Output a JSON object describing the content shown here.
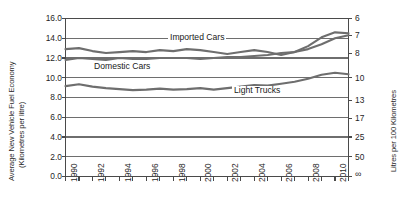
{
  "chart_data": {
    "type": "line",
    "title": "",
    "xlabel": "",
    "ylabel": "Average New Vehicle Fuel Economy (Kilometres per litre)",
    "ylabel_right": "Litres per 100 Kilometres",
    "xlim": [
      1990,
      2011
    ],
    "ylim": [
      0.0,
      16.0
    ],
    "grid": true,
    "legend_position": "inline-labels",
    "y_ticks": [
      "16.0",
      "14.0",
      "12.0",
      "10.0",
      "8.0",
      "6.0",
      "4.0",
      "2.0",
      "0.0"
    ],
    "y_tick_values": [
      16.0,
      14.0,
      12.0,
      10.0,
      8.0,
      6.0,
      4.0,
      2.0,
      0.0
    ],
    "y_ticks_right": [
      "6",
      "7",
      "8",
      "10",
      "13",
      "17",
      "25",
      "50",
      "∞"
    ],
    "y_tick_right_values": [
      16.67,
      14.29,
      12.5,
      10.0,
      7.69,
      5.88,
      4.0,
      2.0,
      0.0
    ],
    "x_ticks_labeled": [
      "1990",
      "1992",
      "1994",
      "1996",
      "1998",
      "2000",
      "2002",
      "2004",
      "2006",
      "2008",
      "2010"
    ],
    "x_tick_values_all": [
      1990,
      1991,
      1992,
      1993,
      1994,
      1995,
      1996,
      1997,
      1998,
      1999,
      2000,
      2001,
      2002,
      2003,
      2004,
      2005,
      2006,
      2007,
      2008,
      2009,
      2010,
      2011
    ],
    "x": [
      1990,
      1991,
      1992,
      1993,
      1994,
      1995,
      1996,
      1997,
      1998,
      1999,
      2000,
      2001,
      2002,
      2003,
      2004,
      2005,
      2006,
      2007,
      2008,
      2009,
      2010,
      2011
    ],
    "series": [
      {
        "name": "Imported Cars",
        "label": "Imported Cars",
        "color": "#6e6e6e",
        "values": [
          12.9,
          13.0,
          12.7,
          12.5,
          12.6,
          12.7,
          12.6,
          12.8,
          12.7,
          12.9,
          12.8,
          12.6,
          12.4,
          12.6,
          12.8,
          12.6,
          12.3,
          12.6,
          13.2,
          14.1,
          14.6,
          14.5
        ]
      },
      {
        "name": "Domestic Cars",
        "label": "Domestic Cars",
        "color": "#6e6e6e",
        "values": [
          11.8,
          12.0,
          11.9,
          11.8,
          12.0,
          11.9,
          11.9,
          12.0,
          12.0,
          12.0,
          11.9,
          12.0,
          12.1,
          12.1,
          12.2,
          12.3,
          12.5,
          12.6,
          12.9,
          13.4,
          14.0,
          14.3
        ]
      },
      {
        "name": "Light Trucks",
        "label": "Light Trucks",
        "color": "#6e6e6e",
        "values": [
          9.15,
          9.35,
          9.1,
          8.95,
          8.85,
          8.75,
          8.8,
          8.9,
          8.8,
          8.85,
          8.95,
          8.8,
          8.95,
          9.1,
          9.25,
          9.2,
          9.4,
          9.6,
          9.9,
          10.3,
          10.5,
          10.35
        ]
      }
    ],
    "plot_bg": "#ffffff",
    "grid_color": "#6e6e6e",
    "axis_color": "#4a4a4a"
  }
}
